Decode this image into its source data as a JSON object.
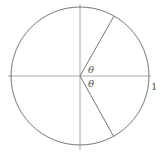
{
  "diagram": {
    "type": "unit-circle",
    "colors": {
      "stroke": "#777777",
      "axis": "#aaaaaa",
      "text": "#555555",
      "background": "#ffffff"
    },
    "circle": {
      "cx": 80,
      "cy": 76,
      "r": 69
    },
    "axes": {
      "horizontal": {
        "x1": 8,
        "x2": 151,
        "y": 76
      },
      "vertical": {
        "x": 80,
        "y1": 4,
        "y2": 150
      }
    },
    "radii": [
      {
        "x2": 114,
        "y2": 16,
        "angle_label": "θ"
      },
      {
        "x2": 114,
        "y2": 137,
        "angle_label": "θ"
      }
    ],
    "labels": {
      "upper_angle": "θ",
      "lower_angle": "θ",
      "radius_mark": "1"
    }
  }
}
